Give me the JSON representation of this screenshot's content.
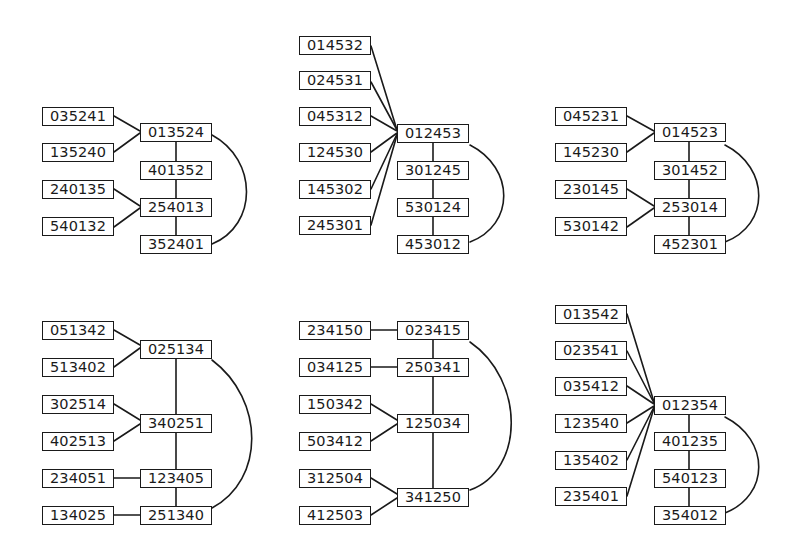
{
  "graphs": [
    {
      "id": "graph-1",
      "hub_nodes": [
        "013524",
        "401352",
        "254013",
        "352401"
      ],
      "leaf_nodes": [
        {
          "label": "035241",
          "connects_to": "013524"
        },
        {
          "label": "135240",
          "connects_to": "013524"
        },
        {
          "label": "240135",
          "connects_to": "254013"
        },
        {
          "label": "540132",
          "connects_to": "254013"
        }
      ],
      "arc": [
        "013524",
        "352401"
      ]
    },
    {
      "id": "graph-2",
      "hub_nodes": [
        "012453",
        "301245",
        "530124",
        "453012"
      ],
      "leaf_nodes": [
        {
          "label": "014532",
          "connects_to": "012453"
        },
        {
          "label": "024531",
          "connects_to": "012453"
        },
        {
          "label": "045312",
          "connects_to": "012453"
        },
        {
          "label": "124530",
          "connects_to": "012453"
        },
        {
          "label": "145302",
          "connects_to": "012453"
        },
        {
          "label": "245301",
          "connects_to": "012453"
        }
      ],
      "arc": [
        "012453",
        "453012"
      ]
    },
    {
      "id": "graph-3",
      "hub_nodes": [
        "014523",
        "301452",
        "253014",
        "452301"
      ],
      "leaf_nodes": [
        {
          "label": "045231",
          "connects_to": "014523"
        },
        {
          "label": "145230",
          "connects_to": "014523"
        },
        {
          "label": "230145",
          "connects_to": "253014"
        },
        {
          "label": "530142",
          "connects_to": "253014"
        }
      ],
      "arc": [
        "014523",
        "452301"
      ]
    },
    {
      "id": "graph-4",
      "hub_nodes": [
        "025134",
        "340251",
        "123405",
        "251340"
      ],
      "leaf_nodes": [
        {
          "label": "051342",
          "connects_to": "025134"
        },
        {
          "label": "513402",
          "connects_to": "025134"
        },
        {
          "label": "302514",
          "connects_to": "340251"
        },
        {
          "label": "402513",
          "connects_to": "340251"
        },
        {
          "label": "234051",
          "connects_to": "123405"
        },
        {
          "label": "134025",
          "connects_to": "251340"
        }
      ],
      "arc": [
        "025134",
        "251340"
      ]
    },
    {
      "id": "graph-5",
      "hub_nodes": [
        "023415",
        "250341",
        "125034",
        "341250"
      ],
      "leaf_nodes": [
        {
          "label": "234150",
          "connects_to": "023415"
        },
        {
          "label": "034125",
          "connects_to": "250341"
        },
        {
          "label": "150342",
          "connects_to": "125034"
        },
        {
          "label": "503412",
          "connects_to": "125034"
        },
        {
          "label": "312504",
          "connects_to": "341250"
        },
        {
          "label": "412503",
          "connects_to": "341250"
        }
      ],
      "arc": [
        "023415",
        "341250"
      ]
    },
    {
      "id": "graph-6",
      "hub_nodes": [
        "012354",
        "401235",
        "540123",
        "354012"
      ],
      "leaf_nodes": [
        {
          "label": "013542",
          "connects_to": "012354"
        },
        {
          "label": "023541",
          "connects_to": "012354"
        },
        {
          "label": "035412",
          "connects_to": "012354"
        },
        {
          "label": "123540",
          "connects_to": "012354"
        },
        {
          "label": "135402",
          "connects_to": "012354"
        },
        {
          "label": "235401",
          "connects_to": "012354"
        }
      ],
      "arc": [
        "012354",
        "354012"
      ]
    }
  ],
  "colors": {
    "stroke": "#1a1a1a",
    "background": "#ffffff"
  }
}
